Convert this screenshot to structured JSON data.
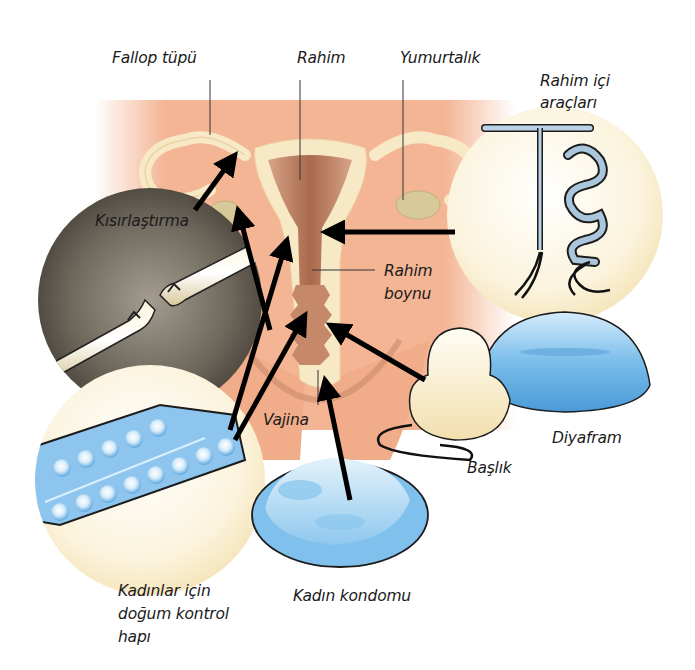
{
  "diagram": {
    "colors": {
      "background": "#ffffff",
      "body_skin": "#f4b595",
      "organ_cream": "#f8e9c6",
      "uterus_inner": "#b77a5a",
      "ovary": "#d8c99a",
      "blue_device": "#6db5e8",
      "sterilization_bg": "#7a7468",
      "arrow": "#000000"
    },
    "labels": {
      "fallopian_tube": "Fallop tüpü",
      "uterus": "Rahim",
      "ovary": "Yumurtalık",
      "iud_line1": "Rahim içi",
      "iud_line2": "araçları",
      "sterilization": "Kısırlaştırma",
      "cervix_line1": "Rahim",
      "cervix_line2": "boynu",
      "vagina": "Vajina",
      "diaphragm": "Diyafram",
      "cap": "Başlık",
      "pill_line1": "Kadınlar için",
      "pill_line2": "doğum kontrol",
      "pill_line3": "hapı",
      "female_condom": "Kadın kondomu"
    },
    "methods": [
      {
        "name": "Kısırlaştırma",
        "target": "Fallop tüpü"
      },
      {
        "name": "Rahim içi araçları",
        "target": "Rahim"
      },
      {
        "name": "Kadınlar için doğum kontrol hapı",
        "target": "Yumurtalık / Rahim boynu"
      },
      {
        "name": "Başlık",
        "target": "Rahim boynu"
      },
      {
        "name": "Diyafram",
        "target": "Rahim boynu"
      },
      {
        "name": "Kadın kondomu",
        "target": "Vajina"
      }
    ]
  }
}
